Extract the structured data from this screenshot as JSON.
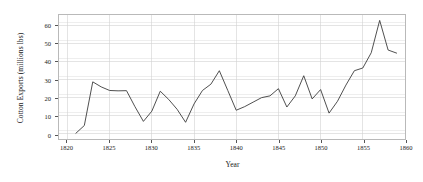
{
  "chart_data": {
    "type": "line",
    "title": "",
    "xlabel": "Year",
    "ylabel": "Cotton Exports (millions lbs)",
    "xlim": [
      1819,
      1860
    ],
    "ylim": [
      -3,
      66
    ],
    "grid": true,
    "legend": "none",
    "xticks": [
      1820,
      1825,
      1830,
      1835,
      1840,
      1845,
      1850,
      1855,
      1860
    ],
    "xtick_labels": [
      "1820",
      "1825",
      "1830",
      "1835",
      "1840",
      "1845",
      "1850",
      "1855",
      "1860"
    ],
    "yticks": [
      0,
      10,
      20,
      30,
      40,
      50,
      60
    ],
    "ytick_labels": [
      "0",
      "10",
      "20",
      "30",
      "40",
      "50",
      "60"
    ],
    "series": [
      {
        "name": "Cotton Exports",
        "color": "#3a3a3a",
        "x": [
          1821,
          1822,
          1823,
          1824,
          1825,
          1826,
          1827,
          1828,
          1829,
          1830,
          1831,
          1832,
          1833,
          1834,
          1835,
          1836,
          1837,
          1838,
          1839,
          1840,
          1841,
          1842,
          1843,
          1844,
          1845,
          1846,
          1847,
          1848,
          1849,
          1850,
          1851,
          1852,
          1853,
          1854,
          1855,
          1856,
          1857,
          1858,
          1859
        ],
        "values": [
          0.2,
          4.5,
          28.8,
          26.0,
          24.0,
          23.8,
          23.9,
          15.0,
          6.8,
          12.5,
          23.6,
          19.0,
          13.5,
          6.3,
          16.5,
          24.0,
          27.5,
          35.0,
          24.0,
          13.0,
          15.0,
          17.5,
          20.0,
          21.0,
          25.0,
          14.8,
          21.0,
          32.2,
          19.3,
          24.5,
          11.4,
          18.0,
          27.0,
          35.0,
          36.5,
          45.0,
          63.0,
          46.5,
          44.8
        ],
        "y_by_year": {
          "1821": 0.2,
          "1822": 4.5,
          "1823": 28.8,
          "1824": 26.0,
          "1825": 24.0,
          "1826": 23.8,
          "1827": 23.9,
          "1828": 15.0,
          "1829": 6.8,
          "1830": 12.5,
          "1831": 23.6,
          "1832": 19.0,
          "1833": 13.5,
          "1834": 6.3,
          "1835": 16.5,
          "1836": 24.0,
          "1837": 27.5,
          "1838": 35.0,
          "1839": 24.0,
          "1840": 13.0,
          "1841": 15.0,
          "1842": 17.5,
          "1843": 20.0,
          "1844": 21.0,
          "1845": 25.0,
          "1846": 14.8,
          "1847": 21.0,
          "1848": 32.2,
          "1849": 19.3,
          "1850": 24.5,
          "1851": 11.4,
          "1852": 18.0,
          "1853": 27.0,
          "1854": 35.0,
          "1855": 36.5,
          "1856": 45.0,
          "1857": 63.0,
          "1858": 46.5,
          "1859": 44.8
        }
      }
    ],
    "notes": {
      "peak_year": "1857",
      "peak_value": "63.0",
      "min_year": "1821",
      "min_value": "0.2"
    }
  },
  "style": {
    "line_color": "#3a3a3a",
    "grid_color": "#e2e2e2",
    "frame_color": "#b9b9b9",
    "background": "#ffffff",
    "text_color": "#1a1a1a"
  }
}
